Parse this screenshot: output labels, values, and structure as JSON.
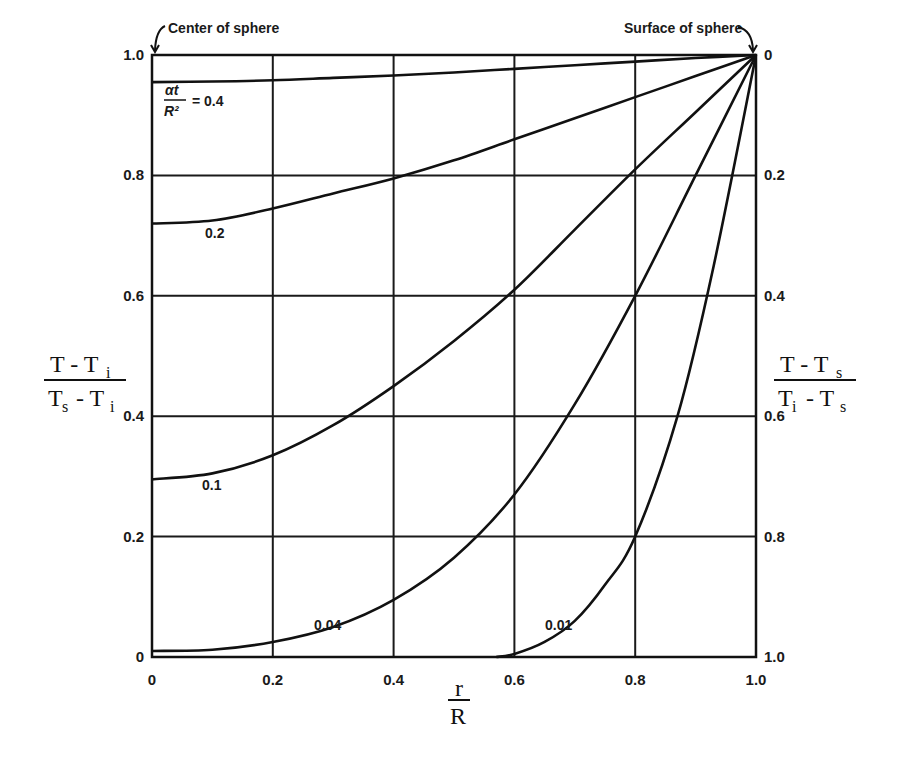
{
  "chart_data": {
    "type": "line",
    "title": "",
    "xlabel": "r / R",
    "xlabel_num": "r",
    "xlabel_den": "R",
    "ylabel_left": "(T - Ti) / (Ts - Ti)",
    "ylabel_right": "(T - Ts) / (Ti - Ts)",
    "xlim": [
      0,
      1.0
    ],
    "ylim": [
      0,
      1.0
    ],
    "grid": true,
    "x_ticks": [
      "0",
      "0.2",
      "0.4",
      "0.6",
      "0.8",
      "1.0"
    ],
    "y_ticks_left": [
      "0",
      "0.2",
      "0.4",
      "0.6",
      "0.8",
      "1.0"
    ],
    "y_ticks_right": [
      "1.0",
      "0.8",
      "0.6",
      "0.4",
      "0.2",
      "0"
    ],
    "annotations": {
      "center": "Center of sphere",
      "surface": "Surface of sphere",
      "param_label_prefix": "αt / R² = "
    },
    "x": [
      0,
      0.1,
      0.2,
      0.3,
      0.4,
      0.5,
      0.6,
      0.7,
      0.8,
      0.9,
      1.0
    ],
    "series": [
      {
        "name": "0.4",
        "label": "0.4",
        "values": [
          0.955,
          0.956,
          0.958,
          0.962,
          0.966,
          0.971,
          0.977,
          0.983,
          0.989,
          0.995,
          1.0
        ]
      },
      {
        "name": "0.2",
        "label": "0.2",
        "values": [
          0.72,
          0.725,
          0.745,
          0.77,
          0.795,
          0.825,
          0.86,
          0.895,
          0.93,
          0.965,
          1.0
        ]
      },
      {
        "name": "0.1",
        "label": "0.1",
        "values": [
          0.295,
          0.305,
          0.335,
          0.385,
          0.45,
          0.525,
          0.61,
          0.71,
          0.81,
          0.905,
          1.0
        ]
      },
      {
        "name": "0.04",
        "label": "0.04",
        "values": [
          0.01,
          0.012,
          0.025,
          0.05,
          0.095,
          0.165,
          0.27,
          0.42,
          0.6,
          0.8,
          1.0
        ]
      },
      {
        "name": "0.01",
        "label": "0.01",
        "values": [
          0,
          0,
          0,
          0,
          0,
          0,
          0.005,
          0.06,
          0.2,
          0.5,
          1.0
        ]
      }
    ]
  }
}
